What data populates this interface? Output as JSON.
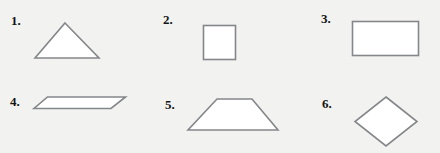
{
  "worksheet": {
    "title": "Geometric shapes identification worksheet",
    "background_color": "#f2f2f0",
    "shape_fill_color": "#ffffff",
    "shape_stroke_color": "#84868a",
    "label_color": "#141414",
    "columns": 3,
    "rows": 2,
    "items": [
      {
        "number": "1.",
        "shape_name": "triangle",
        "description": "isosceles triangle pointing up",
        "points": "32,36 2,36 2,36"
      },
      {
        "number": "2.",
        "shape_name": "square",
        "description": "square"
      },
      {
        "number": "3.",
        "shape_name": "rectangle",
        "description": "horizontal rectangle"
      },
      {
        "number": "4.",
        "shape_name": "parallelogram",
        "description": "flat slanted parallelogram"
      },
      {
        "number": "5.",
        "shape_name": "trapezoid",
        "description": "isosceles trapezoid, long side at bottom"
      },
      {
        "number": "6.",
        "shape_name": "rhombus",
        "description": "diamond / rhombus rotated 45 degrees"
      }
    ]
  }
}
